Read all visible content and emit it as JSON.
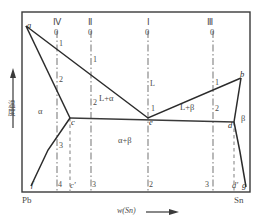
{
  "figure": {
    "kind": "phase-diagram",
    "axis": {
      "x_label": "w(Sn)",
      "x_arrow": "⟶",
      "y_label": "温度",
      "left_end_label": "Pb",
      "right_end_label": "Sn"
    },
    "frame": {
      "x": 22,
      "y": 12,
      "width": 228,
      "height": 180,
      "border_color": "#3a3a3a"
    },
    "vertical_lines": [
      {
        "name": "IV",
        "roman": "Ⅳ",
        "top_number": "0",
        "x": 57,
        "style": "dash-dot",
        "numbers": [
          {
            "text": "1",
            "x": 59,
            "y": 44
          },
          {
            "text": "2",
            "x": 59,
            "y": 82
          },
          {
            "text": "3",
            "x": 59,
            "y": 148
          },
          {
            "text": "4",
            "x": 59,
            "y": 186
          }
        ]
      },
      {
        "name": "II",
        "roman": "Ⅱ",
        "top_number": "0",
        "x": 91,
        "style": "dash-dot",
        "numbers": [
          {
            "text": "1",
            "x": 93,
            "y": 61
          },
          {
            "text": "2",
            "x": 93,
            "y": 104
          },
          {
            "text": "3",
            "x": 93,
            "y": 186
          }
        ]
      },
      {
        "name": "I",
        "roman": "Ⅰ",
        "top_number": "0",
        "x": 148,
        "style": "dash-dot",
        "numbers": [
          {
            "text": "L",
            "x": 150,
            "y": 84
          },
          {
            "text": "1",
            "x": 150,
            "y": 110
          },
          {
            "text": "2",
            "x": 150,
            "y": 186
          }
        ]
      },
      {
        "name": "III",
        "roman": "Ⅲ",
        "top_number": "0",
        "x": 213,
        "style": "dash-dot",
        "numbers": [
          {
            "text": "1",
            "x": 215,
            "y": 84
          },
          {
            "text": "2",
            "x": 215,
            "y": 110
          },
          {
            "text": "3",
            "x": 206,
            "y": 186
          }
        ]
      }
    ],
    "dashed_verticals": [
      {
        "name": "c-prime-line",
        "x": 70,
        "y1": 118,
        "y2": 192
      },
      {
        "name": "d-prime-line",
        "x": 234,
        "y1": 122,
        "y2": 192
      }
    ],
    "points": [
      {
        "label": "a",
        "x": 26,
        "y": 26,
        "anchor": "right-below"
      },
      {
        "label": "b",
        "x": 241,
        "y": 78,
        "anchor": "left-above"
      },
      {
        "label": "c",
        "x": 70,
        "y": 118,
        "anchor": "right"
      },
      {
        "label": "d",
        "x": 234,
        "y": 122,
        "anchor": "left"
      },
      {
        "label": "e",
        "x": 148,
        "y": 118,
        "anchor": "right"
      },
      {
        "label": "f",
        "x": 31,
        "y": 186,
        "anchor": "right"
      },
      {
        "label": "g",
        "x": 245,
        "y": 186,
        "anchor": "left"
      },
      {
        "label": "c'",
        "x": 70,
        "y": 186,
        "anchor": "right"
      },
      {
        "label": "d'",
        "x": 234,
        "y": 186,
        "anchor": "left"
      }
    ],
    "regions": [
      {
        "label": "α",
        "x": 41,
        "y": 112
      },
      {
        "label": "β",
        "x": 244,
        "y": 118
      },
      {
        "label": "L+α",
        "x": 110,
        "y": 100
      },
      {
        "label": "L+β",
        "x": 190,
        "y": 108
      },
      {
        "label": "α+β",
        "x": 128,
        "y": 141
      }
    ],
    "curves": {
      "liquidus_left": "a(26,26) → e(148,118)",
      "liquidus_right": "e(148,118) → b(241,78)",
      "solidus_left": "a(26,26) → c(70,118)",
      "solidus_right": "b(241,78) → d(234,122)",
      "solvus_left": "c(70,118) → f(31,186)",
      "solvus_right": "d(234,122) → g(245,186)",
      "eutectic_horizontal": "c(70,118) → d(234,122)"
    }
  }
}
